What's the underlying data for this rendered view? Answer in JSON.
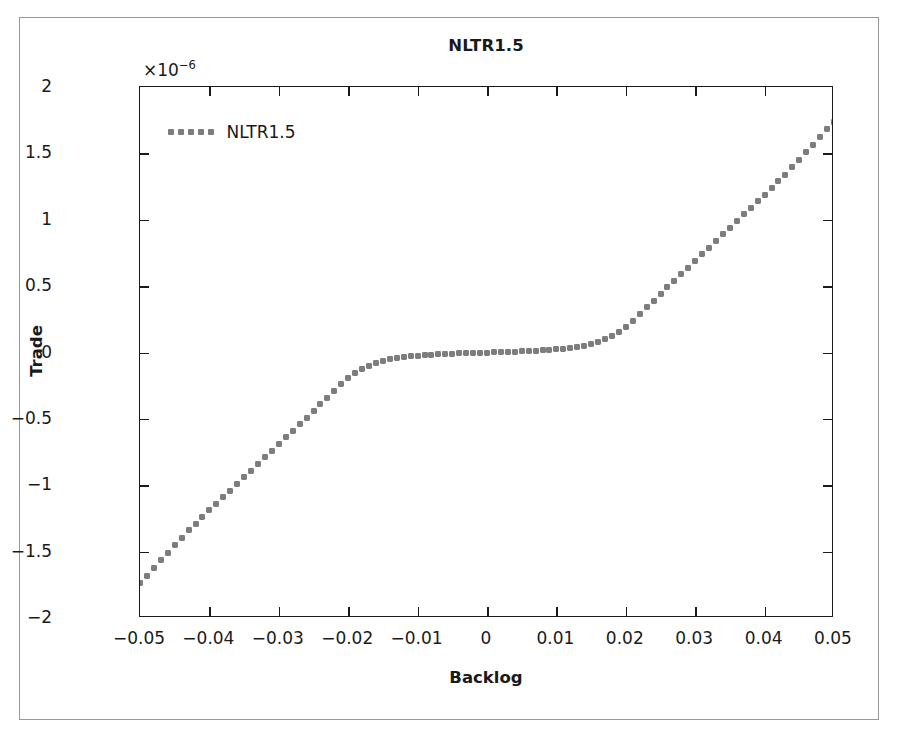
{
  "chart_data": {
    "type": "line",
    "title": "NLTR1.5",
    "xlabel": "Backlog",
    "ylabel": "Trade",
    "y_exponent_label": "×10",
    "y_exponent_power": "−6",
    "y_scale_factor": 1e-06,
    "xlim": [
      -0.05,
      0.05
    ],
    "ylim": [
      -2,
      2
    ],
    "grid": false,
    "legend_position": "upper left",
    "xticks": [
      -0.05,
      -0.04,
      -0.03,
      -0.02,
      -0.01,
      0,
      0.01,
      0.02,
      0.03,
      0.04,
      0.05
    ],
    "xticklabels": [
      "−0.05",
      "−0.04",
      "−0.03",
      "−0.02",
      "−0.01",
      "0",
      "0.01",
      "0.02",
      "0.03",
      "0.04",
      "0.05"
    ],
    "yticks": [
      -2,
      -1.5,
      -1,
      -0.5,
      0,
      0.5,
      1,
      1.5,
      2
    ],
    "yticklabels": [
      "−2",
      "−1.5",
      "−1",
      "−0.5",
      "0",
      "0.5",
      "1",
      "1.5",
      "2"
    ],
    "series": [
      {
        "name": "NLTR1.5",
        "color": "#7d7d7d",
        "linestyle": "dotted",
        "marker": "square-dot",
        "x": [
          -0.05,
          -0.049,
          -0.048,
          -0.047,
          -0.046,
          -0.045,
          -0.044,
          -0.043,
          -0.042,
          -0.041,
          -0.04,
          -0.039,
          -0.038,
          -0.037,
          -0.036,
          -0.035,
          -0.034,
          -0.033,
          -0.032,
          -0.031,
          -0.03,
          -0.029,
          -0.028,
          -0.027,
          -0.026,
          -0.025,
          -0.024,
          -0.023,
          -0.022,
          -0.021,
          -0.02,
          -0.019,
          -0.018,
          -0.017,
          -0.016,
          -0.015,
          -0.014,
          -0.013,
          -0.012,
          -0.011,
          -0.01,
          -0.009,
          -0.008,
          -0.007,
          -0.006,
          -0.005,
          -0.004,
          -0.003,
          -0.002,
          -0.001,
          0,
          0.001,
          0.002,
          0.003,
          0.004,
          0.005,
          0.006,
          0.007,
          0.008,
          0.009,
          0.01,
          0.011,
          0.012,
          0.013,
          0.014,
          0.015,
          0.016,
          0.017,
          0.018,
          0.019,
          0.02,
          0.021,
          0.022,
          0.023,
          0.024,
          0.025,
          0.026,
          0.027,
          0.028,
          0.029,
          0.03,
          0.031,
          0.032,
          0.033,
          0.034,
          0.035,
          0.036,
          0.037,
          0.038,
          0.039,
          0.04,
          0.041,
          0.042,
          0.043,
          0.044,
          0.045,
          0.046,
          0.047,
          0.048,
          0.049,
          0.05
        ],
        "y": [
          -1.74,
          -1.68,
          -1.62,
          -1.56,
          -1.51,
          -1.45,
          -1.4,
          -1.34,
          -1.29,
          -1.24,
          -1.19,
          -1.14,
          -1.09,
          -1.04,
          -0.99,
          -0.94,
          -0.89,
          -0.84,
          -0.79,
          -0.74,
          -0.69,
          -0.64,
          -0.59,
          -0.54,
          -0.49,
          -0.44,
          -0.39,
          -0.34,
          -0.29,
          -0.24,
          -0.19,
          -0.155,
          -0.125,
          -0.1,
          -0.08,
          -0.065,
          -0.052,
          -0.042,
          -0.034,
          -0.028,
          -0.023,
          -0.019,
          -0.016,
          -0.013,
          -0.011,
          -0.009,
          -0.007,
          -0.005,
          -0.003,
          -0.0015,
          0.0,
          0.0015,
          0.003,
          0.005,
          0.007,
          0.009,
          0.011,
          0.013,
          0.016,
          0.019,
          0.023,
          0.028,
          0.034,
          0.042,
          0.052,
          0.065,
          0.08,
          0.1,
          0.125,
          0.155,
          0.19,
          0.24,
          0.29,
          0.34,
          0.39,
          0.44,
          0.49,
          0.54,
          0.59,
          0.64,
          0.69,
          0.74,
          0.79,
          0.84,
          0.89,
          0.94,
          0.99,
          1.04,
          1.09,
          1.14,
          1.19,
          1.24,
          1.29,
          1.34,
          1.4,
          1.45,
          1.51,
          1.56,
          1.62,
          1.68,
          1.74
        ]
      }
    ]
  },
  "legend": {
    "entries": [
      {
        "label": "NLTR1.5",
        "marker_dots": 5
      }
    ]
  },
  "colors": {
    "series": "#7d7d7d",
    "axis": "#1a1a1a",
    "figure_border": "#999999",
    "background": "#ffffff"
  }
}
